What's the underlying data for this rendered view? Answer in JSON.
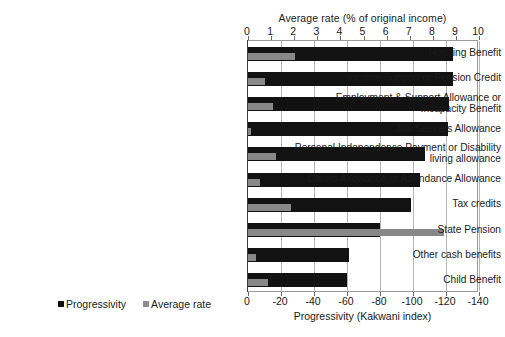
{
  "chart_data": {
    "type": "bar",
    "orientation": "horizontal",
    "title": "",
    "categories": [
      "Housing Benefit",
      "Income Support or Pension Credit",
      "Employment & Support Allowance or\nIncapacity Benefit",
      "Job Seekers Allowance",
      "Personal Independence Payment or Disability\nliving allowance",
      "Carers Allowance or Attendance Allowance",
      "Tax credits",
      "State Pension",
      "Other cash benefits",
      "Child Benefit"
    ],
    "series": [
      {
        "name": "Progressivity",
        "axis": "bottom",
        "color": "#121212",
        "values": [
          -124,
          -124,
          -122,
          -121,
          -107,
          -104,
          -99,
          -80,
          -61,
          -60
        ]
      },
      {
        "name": "Average rate",
        "axis": "top",
        "color": "#888888",
        "values": [
          2.05,
          0.75,
          1.1,
          0.15,
          1.2,
          0.5,
          1.85,
          8.5,
          0.35,
          0.85
        ]
      }
    ],
    "top_axis": {
      "label": "Average rate  (% of original income)",
      "ticks": [
        0,
        1,
        2,
        3,
        4,
        5,
        6,
        7,
        8,
        9,
        10
      ],
      "tick_labels": [
        "0",
        "1",
        "2",
        "3",
        "4",
        "5",
        "6",
        "7",
        "8",
        "9",
        "10"
      ],
      "range": [
        0,
        10
      ]
    },
    "bottom_axis": {
      "label": "Progressivity (Kakwani index)",
      "ticks": [
        0,
        -20,
        -40,
        -60,
        -80,
        -100,
        -120,
        -140
      ],
      "tick_labels": [
        "0",
        "-20",
        "-40",
        "-60",
        "-80",
        "-100",
        "-120",
        "-140"
      ],
      "range": [
        0,
        -140
      ]
    },
    "legend": {
      "position": "bottom-left",
      "entries": [
        {
          "label": "Progressivity",
          "color": "#121212"
        },
        {
          "label": "Average rate",
          "color": "#8c8c8c"
        }
      ]
    },
    "grid": {
      "vertical": true,
      "horizontal": false
    }
  }
}
